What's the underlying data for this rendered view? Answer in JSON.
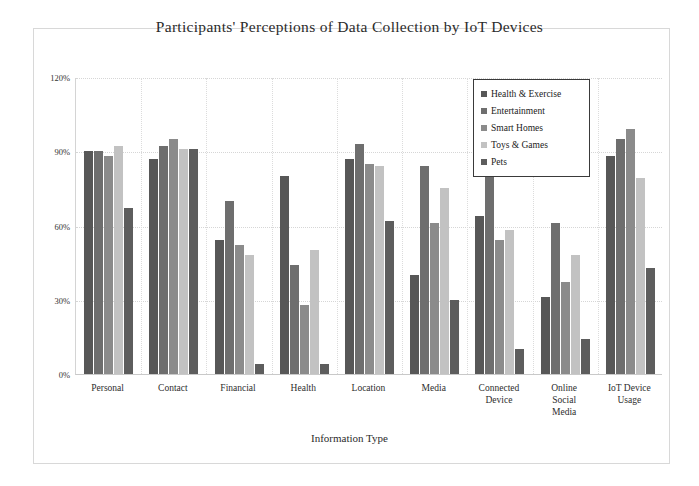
{
  "chart_data": {
    "type": "bar",
    "title": "Participants' Perceptions of Data Collection by IoT Devices",
    "xlabel": "Information Type",
    "ylabel": "",
    "ylim": [
      0,
      120
    ],
    "yticks": [
      "0%",
      "30%",
      "60%",
      "90%",
      "120%"
    ],
    "ytick_values": [
      0,
      30,
      60,
      90,
      120
    ],
    "grid": true,
    "legend_position": "upper right",
    "categories": [
      "Personal",
      "Contact",
      "Financial",
      "Health",
      "Location",
      "Media",
      "Connected Device",
      "Online Social Media",
      "IoT Device Usage"
    ],
    "series": [
      {
        "name": "Health & Exercise",
        "color": "#575757",
        "values": [
          90,
          87,
          54,
          80,
          87,
          40,
          64,
          31,
          88
        ]
      },
      {
        "name": "Entertainment",
        "color": "#6e6e6e",
        "values": [
          90,
          92,
          70,
          44,
          93,
          84,
          84,
          61,
          95
        ]
      },
      {
        "name": "Smart Homes",
        "color": "#8b8b8b",
        "values": [
          88,
          95,
          52,
          28,
          85,
          61,
          54,
          37,
          99
        ]
      },
      {
        "name": "Toys & Games",
        "color": "#c2c2c2",
        "values": [
          92,
          91,
          48,
          50,
          84,
          75,
          58,
          48,
          79
        ]
      },
      {
        "name": "Pets",
        "color": "#5d5d5d",
        "values": [
          67,
          91,
          4,
          4,
          62,
          30,
          10,
          14,
          43
        ]
      }
    ]
  }
}
